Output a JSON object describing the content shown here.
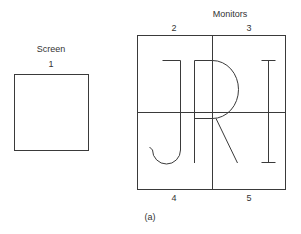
{
  "screen": {
    "title": "Screen",
    "number": "1"
  },
  "monitors": {
    "title": "Monitors",
    "top_numbers": [
      "2",
      "3"
    ],
    "bottom_numbers": [
      "4",
      "5"
    ]
  },
  "display_letters": "JRI",
  "caption": "(a)",
  "colors": {
    "line": "#3a3a3a",
    "background": "#ffffff"
  }
}
